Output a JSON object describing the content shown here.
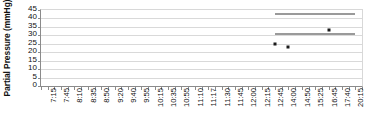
{
  "chart_data": {
    "type": "scatter",
    "title": "",
    "xlabel": "",
    "ylabel": "Partial Pressure (mmHg)",
    "ylim": [
      0,
      45
    ],
    "ytick_values": [
      45,
      40,
      35,
      30,
      25,
      20,
      15,
      10,
      5,
      0
    ],
    "ytick_labels": [
      "45",
      "40",
      "35",
      "30",
      "25",
      "20",
      "15",
      "10",
      "5",
      "0"
    ],
    "grid": true,
    "legend": "none",
    "categories": [
      "7:15",
      "7:45",
      "8:10",
      "8:35",
      "8:50",
      "9:20",
      "9:40",
      "9:55",
      "10:15",
      "10:35",
      "10:55",
      "11:10",
      "11:17",
      "11:30",
      "11:45",
      "12:00",
      "12:15",
      "12:45",
      "14:00",
      "14:50",
      "15:25",
      "16:45",
      "17:40",
      "20:15"
    ],
    "series": [
      {
        "name": "Measured Partial Pressure",
        "marker": "square",
        "color": "#1a1a1a",
        "points": [
          {
            "x": "12:45",
            "y": 25
          },
          {
            "x": "14:00",
            "y": 23
          },
          {
            "x": "16:45",
            "y": 33
          }
        ]
      },
      {
        "name": "Upper Reference Line",
        "marker": "line",
        "color": "#9a9a9a",
        "y": 43,
        "x_start": "12:45",
        "x_end": "20:15"
      },
      {
        "name": "Lower Reference Line",
        "marker": "line",
        "color": "#9a9a9a",
        "y": 31,
        "x_start": "12:45",
        "x_end": "20:15"
      }
    ]
  }
}
